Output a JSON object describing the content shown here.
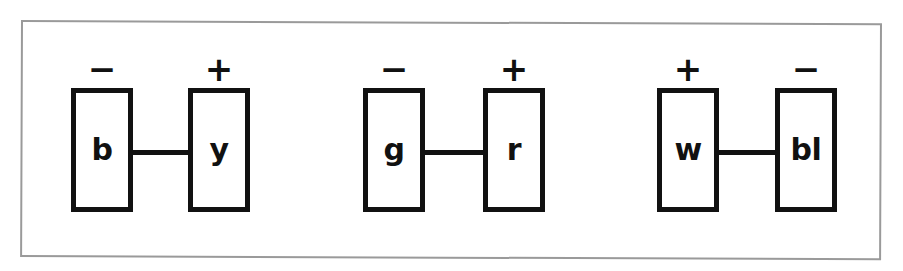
{
  "figure": {
    "name": "three-connector-pairs-diagram",
    "background_color": "#ffffff",
    "ink_color": "#111111",
    "frame_color": "#9a9a9a",
    "pairs": [
      {
        "id": "pair-b-y",
        "left": {
          "label": "b",
          "polarity": "−",
          "polarity_name": "minus"
        },
        "right": {
          "label": "y",
          "polarity": "+",
          "polarity_name": "plus"
        }
      },
      {
        "id": "pair-g-r",
        "left": {
          "label": "g",
          "polarity": "−",
          "polarity_name": "minus"
        },
        "right": {
          "label": "r",
          "polarity": "+",
          "polarity_name": "plus"
        }
      },
      {
        "id": "pair-w-bl",
        "left": {
          "label": "w",
          "polarity": "+",
          "polarity_name": "plus"
        },
        "right": {
          "label": "bl",
          "polarity": "−",
          "polarity_name": "minus"
        }
      }
    ]
  }
}
